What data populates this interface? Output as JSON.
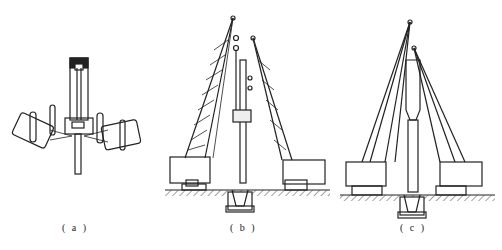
{
  "figure": {
    "panels": [
      {
        "id": "a",
        "label": "( a )",
        "description": "Top view of pile frame with two crawler units swung"
      },
      {
        "id": "b",
        "label": "( b )",
        "description": "Two crawler cranes with lattice booms lifting a pile and hammer"
      },
      {
        "id": "c",
        "label": "( c )",
        "description": "Two crawler cranes with lattice booms holding a pile with cap"
      }
    ],
    "colors": {
      "line": "#222222",
      "background": "#ffffff"
    }
  }
}
